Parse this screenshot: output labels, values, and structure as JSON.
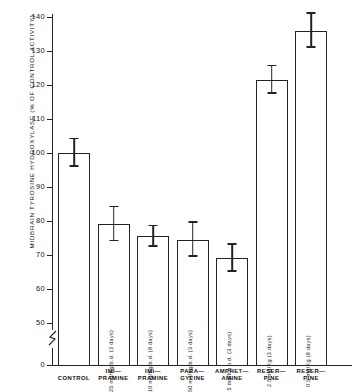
{
  "chart_data": {
    "type": "bar",
    "title": "",
    "xlabel": "",
    "ylabel": "MIDBRAIN  TYROSINE  HYDROXYLASE  (%  OF  CONTROL  ACTIVITY)",
    "ylim": [
      0,
      140
    ],
    "y_ticks": [
      0,
      50,
      60,
      70,
      80,
      90,
      100,
      110,
      120,
      130,
      140
    ],
    "y_tick_labels": [
      "0",
      "50",
      "60",
      "70",
      "80",
      "90",
      "100",
      "110",
      "120",
      "130",
      "140"
    ],
    "axis_break": true,
    "axis_break_note": "y-axis broken between 0 and 50",
    "grid": false,
    "legend": false,
    "categories": [
      "CONTROL",
      "IMI-PRAMINE",
      "IMI-PRAMINE",
      "PARA-GYLINE",
      "AMPHET-AMINE",
      "RESER-PINE",
      "RESER-PINE"
    ],
    "values": [
      100,
      79,
      75.5,
      74.5,
      69,
      121.5,
      136
    ],
    "errors": [
      4,
      5,
      3,
      5,
      4,
      4,
      5
    ],
    "dose_annotations": [
      "",
      "25 mg/Kg b.d. (3 days)",
      "10 mg/Kg b.d. (8 days)",
      "50 mg/Kg b.d. (3 days)",
      "5 mg/Kg b.d. (3 days)",
      "2.5 mg/Kg (3 days)",
      "0.5 mg/Kg (8 days)"
    ]
  },
  "bars": [
    {
      "label_line1": "CONTROL",
      "label_line2": "",
      "dose": "",
      "value": 100,
      "error": 4
    },
    {
      "label_line1": "IMI—",
      "label_line2": "PRAMINE",
      "dose": "25 mg/Kg b.d. (3 days)",
      "value": 79,
      "error": 5
    },
    {
      "label_line1": "IMI—",
      "label_line2": "PRAMINE",
      "dose": "10 mg/Kg b.d. (8 days)",
      "value": 75.5,
      "error": 3
    },
    {
      "label_line1": "PARA—",
      "label_line2": "GYLINE",
      "dose": "50 mg/Kg b.d. (3 days)",
      "value": 74.5,
      "error": 5
    },
    {
      "label_line1": "AMPHET—",
      "label_line2": "AMINE",
      "dose": "5 mg/Kg b.d. (3 days)",
      "value": 69,
      "error": 4
    },
    {
      "label_line1": "RESER—",
      "label_line2": "PINE",
      "dose": "2.5 mg/Kg (3 days)",
      "value": 121.5,
      "error": 4
    },
    {
      "label_line1": "RESER—",
      "label_line2": "PINE",
      "dose": "0.5 mg/Kg (8 days)",
      "value": 136,
      "error": 5
    }
  ],
  "axis": {
    "y_title": "MIDBRAIN  TYROSINE  HYDROXYLASE  (%  OF  CONTROL  ACTIVITY)",
    "ticks": [
      "140",
      "130",
      "120",
      "110",
      "100",
      "90",
      "80",
      "70",
      "60",
      "50",
      "0"
    ]
  },
  "colors": {
    "bar_outline": "#232323",
    "bar_fill": "#ffffff",
    "axis": "#222222",
    "text": "#111111",
    "background": "#ffffff"
  }
}
